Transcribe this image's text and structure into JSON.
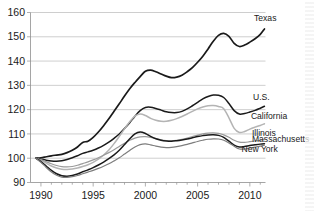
{
  "chart_data": {
    "type": "line",
    "title": "",
    "subtitle": "",
    "xlabel": "",
    "ylabel": "",
    "xlim": [
      1989.0,
      2011.5
    ],
    "ylim": [
      90,
      160
    ],
    "grid": true,
    "grid_axis": "y",
    "legend_position": "right-inline-labels",
    "y_ticks": [
      90,
      100,
      110,
      120,
      130,
      140,
      150,
      160
    ],
    "y_tick_labels": [
      "90",
      "100",
      "110",
      "120",
      "130",
      "140",
      "150",
      "160"
    ],
    "x_ticks": [
      1990,
      1995,
      2000,
      2005,
      2010
    ],
    "x_tick_labels": [
      "1990",
      "1995",
      "2000",
      "2005",
      "2010"
    ],
    "x_minor_ticks": [
      1991,
      1992,
      1993,
      1994,
      1996,
      1997,
      1998,
      1999,
      2001,
      2002,
      2003,
      2004,
      2006,
      2007,
      2008,
      2009,
      2011
    ],
    "x": [
      1989.5,
      1990,
      1990.5,
      1991,
      1991.5,
      1992,
      1992.5,
      1993,
      1993.5,
      1994,
      1994.5,
      1995,
      1995.5,
      1996,
      1996.5,
      1997,
      1997.5,
      1998,
      1998.5,
      1999,
      1999.5,
      2000,
      2000.5,
      2001,
      2001.5,
      2002,
      2002.5,
      2003,
      2003.5,
      2004,
      2004.5,
      2005,
      2005.5,
      2006,
      2006.5,
      2007,
      2007.5,
      2008,
      2008.5,
      2009,
      2009.5,
      2010,
      2010.5,
      2011,
      2011.4
    ],
    "series": [
      {
        "name": "Texas",
        "color": "#1a1a1a",
        "width": 1.7,
        "label_x": 2010.4,
        "label_y": 156.5,
        "values": [
          100,
          100.2,
          100.6,
          101.0,
          101.3,
          101.6,
          102.3,
          103.3,
          104.6,
          106.5,
          107.0,
          108.6,
          110.8,
          113.4,
          116.2,
          119.3,
          122.4,
          125.6,
          128.6,
          131.2,
          133.6,
          135.8,
          136.3,
          135.6,
          134.7,
          133.8,
          133.2,
          133.4,
          134.2,
          135.6,
          137.3,
          139.5,
          142.0,
          145.0,
          148.2,
          150.6,
          151.4,
          150.2,
          147.3,
          146.0,
          146.6,
          147.8,
          149.2,
          151.0,
          153.2
        ]
      },
      {
        "name": "U.S.",
        "color": "#1a1a1a",
        "width": 1.5,
        "label_x": 2010.3,
        "label_y": 124.0,
        "values": [
          100,
          99.6,
          99.2,
          98.9,
          98.8,
          99.0,
          99.5,
          100.2,
          101.0,
          102.0,
          102.6,
          103.3,
          104.2,
          105.3,
          106.6,
          108.2,
          110.0,
          112.2,
          114.6,
          117.3,
          119.6,
          120.9,
          121.0,
          120.5,
          119.8,
          119.1,
          118.8,
          118.8,
          119.3,
          120.3,
          121.6,
          123.0,
          124.4,
          125.4,
          126.0,
          125.9,
          125.0,
          122.5,
          119.6,
          118.2,
          118.4,
          119.0,
          119.7,
          120.6,
          121.4
        ]
      },
      {
        "name": "California",
        "color": "#b4b4b4",
        "width": 1.5,
        "label_x": 2010.1,
        "label_y": 116.0,
        "values": [
          100,
          99.2,
          98.0,
          96.8,
          96.0,
          95.5,
          95.4,
          95.6,
          96.0,
          96.6,
          97.3,
          98.3,
          99.6,
          101.3,
          103.4,
          106.0,
          109.0,
          112.1,
          115.0,
          117.3,
          118.2,
          117.6,
          116.4,
          115.6,
          115.2,
          115.2,
          115.6,
          116.3,
          117.2,
          118.2,
          119.3,
          120.3,
          121.1,
          121.6,
          121.7,
          121.3,
          120.4,
          116.6,
          112.3,
          110.6,
          111.0,
          112.0,
          112.8,
          113.5,
          114.2
        ]
      },
      {
        "name": "Illinois",
        "color": "#9a9a9a",
        "width": 1.2,
        "label_x": 2010.2,
        "label_y": 109.2,
        "values": [
          100,
          99.4,
          98.6,
          97.7,
          97.0,
          96.5,
          96.4,
          96.6,
          97.1,
          97.8,
          98.5,
          99.3,
          100.2,
          101.2,
          102.3,
          103.5,
          104.8,
          106.2,
          107.4,
          108.3,
          108.8,
          108.9,
          108.6,
          108.1,
          107.6,
          107.3,
          107.2,
          107.4,
          107.8,
          108.3,
          108.9,
          109.5,
          110.0,
          110.3,
          110.4,
          110.2,
          109.6,
          108.6,
          107.4,
          106.6,
          106.5,
          106.8,
          107.1,
          107.4,
          107.7
        ]
      },
      {
        "name": "Massachusetts",
        "color": "#1a1a1a",
        "width": 1.5,
        "label_x": 2010.2,
        "label_y": 106.6,
        "values": [
          100,
          98.6,
          96.8,
          95.0,
          93.6,
          92.8,
          92.6,
          92.9,
          93.5,
          94.4,
          95.2,
          96.1,
          97.2,
          98.4,
          99.8,
          101.4,
          103.3,
          105.6,
          108.0,
          110.0,
          110.8,
          110.2,
          109.0,
          108.0,
          107.4,
          107.1,
          107.0,
          107.2,
          107.5,
          107.9,
          108.4,
          108.9,
          109.3,
          109.6,
          109.7,
          109.4,
          108.6,
          107.0,
          105.4,
          104.6,
          104.8,
          105.2,
          105.5,
          105.8,
          106.0
        ]
      },
      {
        "name": "New York",
        "color": "#7d7d7d",
        "width": 1.2,
        "label_x": 2009.2,
        "label_y": 102.6,
        "values": [
          100,
          98.3,
          96.2,
          94.3,
          93.0,
          92.2,
          92.1,
          92.4,
          92.9,
          93.6,
          94.3,
          95.0,
          95.8,
          96.7,
          97.7,
          98.9,
          100.2,
          101.7,
          103.2,
          104.6,
          105.6,
          105.9,
          105.5,
          105.0,
          104.6,
          104.4,
          104.5,
          104.8,
          105.2,
          105.7,
          106.3,
          106.9,
          107.4,
          107.8,
          108.0,
          107.9,
          107.4,
          106.3,
          104.9,
          103.8,
          103.8,
          104.2,
          104.6,
          105.0,
          105.4
        ]
      }
    ]
  },
  "axis": {
    "y_label_texts": [
      "160",
      "150",
      "140",
      "130",
      "120",
      "110",
      "100",
      "90"
    ],
    "x_label_texts": [
      "1990",
      "1995",
      "2000",
      "2005",
      "2010"
    ]
  }
}
